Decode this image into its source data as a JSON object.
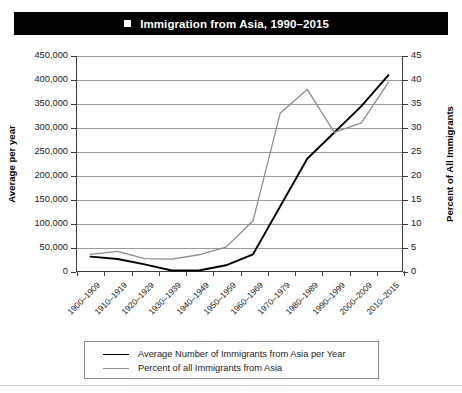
{
  "header": {
    "figure_number": "FIGURE 8.4",
    "marker": "square-bullet",
    "title": "Immigration from Asia, 1990–2015"
  },
  "axis_titles": {
    "left": "Average per year",
    "right": "Percent of All Immigrants"
  },
  "legend": {
    "items": [
      {
        "label": "Average Number of Immigrants from Asia per Year",
        "color": "#000000",
        "series": "average_per_year"
      },
      {
        "label": "Percent of all Immigrants from Asia",
        "color": "#8c8c8c",
        "series": "percent_of_all_immigrants"
      }
    ]
  },
  "chart_data": {
    "type": "line",
    "title": "Immigration from Asia, 1990–2015",
    "xlabel": "",
    "ylabel": "Average per year",
    "y2label": "Percent of All Immigrants",
    "grid": true,
    "legend_position": "bottom",
    "categories": [
      "1900–1909",
      "1910–1919",
      "1920–1929",
      "1930–1939",
      "1940–1949",
      "1950–1959",
      "1960–1969",
      "1970–1979",
      "1980–1989",
      "1990–1999",
      "2000–2009",
      "2010–2015"
    ],
    "ylim": [
      0,
      450000
    ],
    "y2lim": [
      0,
      45
    ],
    "yticks": [
      "0",
      "50,000",
      "100,000",
      "150,000",
      "200,000",
      "250,000",
      "300,000",
      "350,000",
      "400,000",
      "450,000"
    ],
    "ytick_values": [
      0,
      50000,
      100000,
      150000,
      200000,
      250000,
      300000,
      350000,
      400000,
      450000
    ],
    "y2ticks": [
      "0",
      "5",
      "10",
      "15",
      "20",
      "25",
      "30",
      "35",
      "40",
      "45"
    ],
    "y2tick_values": [
      0,
      5,
      10,
      15,
      20,
      25,
      30,
      35,
      40,
      45
    ],
    "series": [
      {
        "name": "Average Number of Immigrants from Asia per Year",
        "axis": "left",
        "color": "#000000",
        "values": [
          30000,
          25000,
          14000,
          1000,
          1000,
          12000,
          35000,
          135000,
          235000,
          290000,
          345000,
          410000
        ]
      },
      {
        "name": "Percent of all Immigrants from Asia",
        "axis": "right",
        "color": "#8c8c8c",
        "values": [
          3.5,
          4.1,
          2.6,
          2.5,
          3.4,
          5.0,
          10.5,
          33.0,
          38.0,
          29.0,
          31.0,
          39.5
        ]
      }
    ]
  }
}
